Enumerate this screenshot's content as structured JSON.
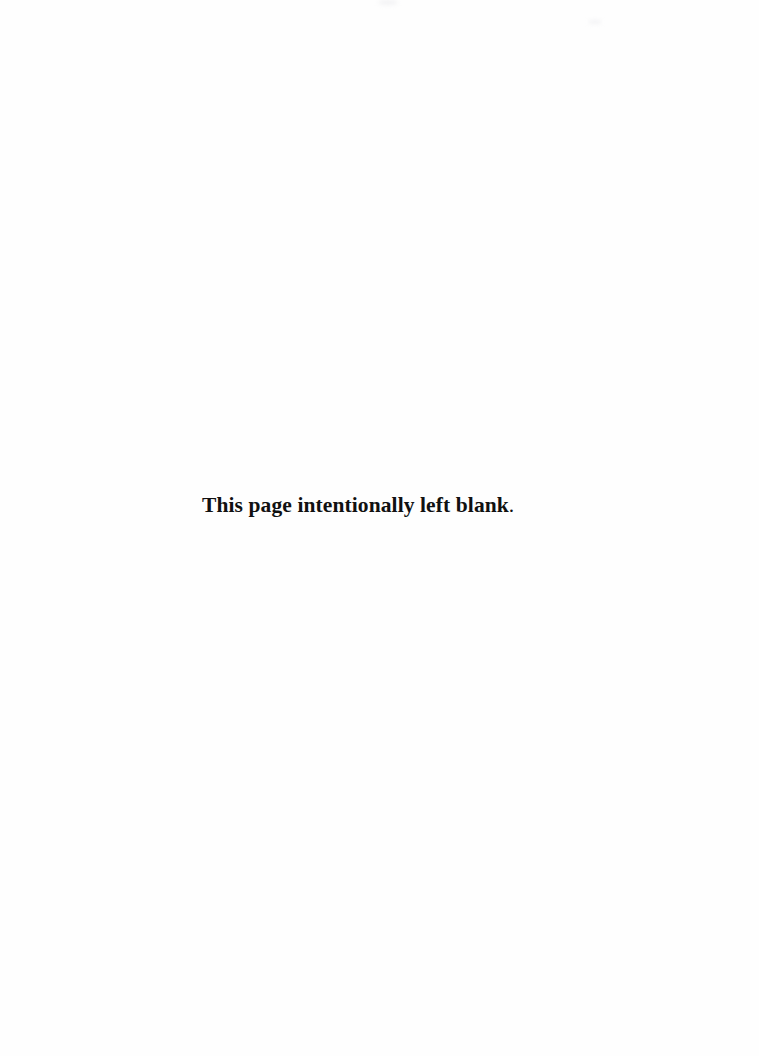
{
  "page": {
    "notice_text": "This page intentionally left blank",
    "notice_punctuation": ".",
    "background_color": "#fefefe",
    "text_color": "#111111"
  }
}
